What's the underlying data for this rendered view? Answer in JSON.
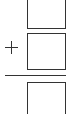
{
  "problem": {
    "type": "vertical-addition",
    "operator": "+",
    "operator_icon": "plus-icon",
    "addend_1": "",
    "addend_2": "",
    "sum": "",
    "line_color": "#333333"
  }
}
